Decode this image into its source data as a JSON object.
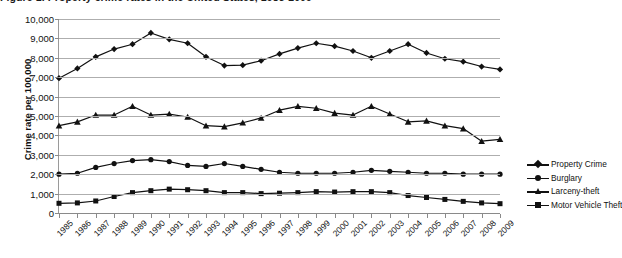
{
  "chart": {
    "title": "Figure 1. Property crime rates in the United States, 1985-2009",
    "ylabel": "Crime rate per 100,000"
  },
  "legend": {
    "position": "right",
    "items": [
      {
        "label": "Property Crime",
        "marker": "diamond"
      },
      {
        "label": "Burglary",
        "marker": "circle"
      },
      {
        "label": "Larceny-theft",
        "marker": "triangle"
      },
      {
        "label": "Motor Vehicle Theft",
        "marker": "square"
      }
    ]
  },
  "chart_data": {
    "type": "line",
    "title": "Figure 1. Property crime rates in the United States, 1985-2009",
    "xlabel": "",
    "ylabel": "Crime rate per 100,000",
    "ylim": [
      0,
      10000
    ],
    "ytick_labels": [
      "10,000",
      "9,000",
      "8,000",
      "7,000",
      "6,000",
      "5,000",
      "4,000",
      "3,000",
      "2,000",
      "1,000",
      "0"
    ],
    "yticks": [
      10000,
      9000,
      8000,
      7000,
      6000,
      5000,
      4000,
      3000,
      2000,
      1000,
      0
    ],
    "grid": true,
    "categories": [
      "1985",
      "1986",
      "1987",
      "1988",
      "1989",
      "1990",
      "1991",
      "1992",
      "1993",
      "1994",
      "1995",
      "1996",
      "1997",
      "1998",
      "1999",
      "2000",
      "2001",
      "2002",
      "2003",
      "2004",
      "2005",
      "2006",
      "2007",
      "2008",
      "2009"
    ],
    "series": [
      {
        "name": "Property Crime",
        "marker": "diamond",
        "color": "#111111",
        "values": [
          6950,
          7450,
          8050,
          8450,
          8700,
          9280,
          8950,
          8750,
          8050,
          7600,
          7620,
          7850,
          8200,
          8500,
          8750,
          8600,
          8350,
          8000,
          8350,
          8700,
          8250,
          7950,
          7800,
          7550,
          7400
        ]
      },
      {
        "name": "Burglary",
        "marker": "circle",
        "color": "#111111",
        "values": [
          2000,
          2050,
          2350,
          2550,
          2700,
          2750,
          2650,
          2450,
          2400,
          2550,
          2400,
          2250,
          2100,
          2050,
          2050,
          2050,
          2100,
          2200,
          2150,
          2100,
          2050,
          2050,
          2000,
          2000,
          2000
        ]
      },
      {
        "name": "Larceny-theft",
        "marker": "triangle",
        "color": "#111111",
        "values": [
          4500,
          4700,
          5050,
          5050,
          5500,
          5050,
          5100,
          4950,
          4500,
          4450,
          4650,
          4900,
          5300,
          5500,
          5400,
          5150,
          5050,
          5500,
          5100,
          4700,
          4750,
          4500,
          4350,
          3700,
          3800
        ]
      },
      {
        "name": "Motor Vehicle Theft",
        "marker": "square",
        "color": "#111111",
        "values": [
          500,
          520,
          620,
          850,
          1050,
          1150,
          1230,
          1200,
          1150,
          1050,
          1050,
          1000,
          1020,
          1050,
          1100,
          1080,
          1100,
          1100,
          1050,
          900,
          800,
          700,
          600,
          520,
          480
        ]
      }
    ]
  }
}
